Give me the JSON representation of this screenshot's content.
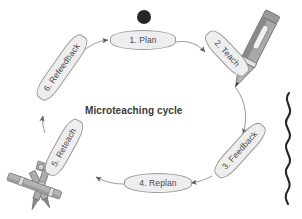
{
  "diagram": {
    "title": "Microteaching cycle",
    "flow_direction": "clockwise",
    "center_dot": "black-dot-marker",
    "stages": [
      {
        "id": "plan",
        "label": "1. Plan",
        "angle_deg": 0
      },
      {
        "id": "teach",
        "label": "2. Teach",
        "angle_deg": 47
      },
      {
        "id": "feedback",
        "label": "3. Feedback",
        "angle_deg": -48
      },
      {
        "id": "replan",
        "label": "4. Replan",
        "angle_deg": 0
      },
      {
        "id": "reteach",
        "label": "5. Reteach",
        "angle_deg": -61
      },
      {
        "id": "refeedback",
        "label": "6. Refeedback",
        "angle_deg": -55
      }
    ],
    "decorations": [
      {
        "id": "pencil",
        "name": "pencil-illustration"
      },
      {
        "id": "squiggle",
        "name": "wavy-line-illustration"
      },
      {
        "id": "compass",
        "name": "drawing-compass-illustration"
      }
    ],
    "colors": {
      "background": "#ffffff",
      "box_fill": "#eeeeee",
      "box_border": "#9a9a9a",
      "text": "#4a4a4a",
      "title_text": "#3a3a3a",
      "arrow": "#6e6e6e",
      "dot": "#262626",
      "pencil_body": "#8c8c8c",
      "pencil_light": "#c9c9c9",
      "squiggle": "#2b2b2b",
      "compass": "#9b9b9b"
    }
  }
}
